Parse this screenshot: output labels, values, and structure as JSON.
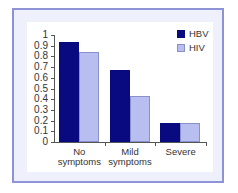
{
  "chart_data": {
    "type": "bar",
    "title": "",
    "xlabel": "",
    "ylabel": "",
    "ylim": [
      0,
      1
    ],
    "yticks": [
      "0",
      "0.1",
      "0.2",
      "0.3",
      "0.4",
      "0.5",
      "0.6",
      "0.7",
      "0.8",
      "0.9",
      "1"
    ],
    "categories": [
      "No symptoms",
      "Mild symptoms",
      "Severe"
    ],
    "category_lines": [
      [
        "No",
        "symptoms"
      ],
      [
        "Mild",
        "symptoms"
      ],
      [
        "Severe",
        ""
      ]
    ],
    "series": [
      {
        "name": "HBV",
        "color": "#0a0a80",
        "values": [
          0.93,
          0.67,
          0.18
        ]
      },
      {
        "name": "HIV",
        "color": "#b8bff0",
        "values": [
          0.84,
          0.43,
          0.18
        ]
      }
    ],
    "legend_position": "top-right",
    "grid": false
  }
}
